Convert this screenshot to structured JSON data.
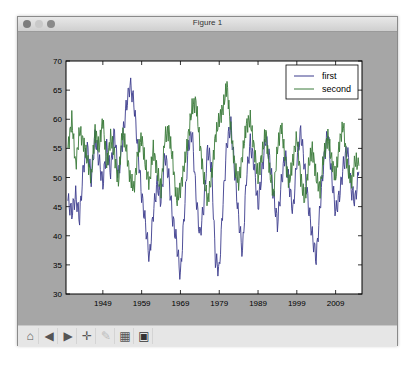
{
  "window": {
    "title": "Figure 1"
  },
  "toolbar": {
    "buttons": [
      {
        "name": "home-icon",
        "glyph": "⌂",
        "label": "Home"
      },
      {
        "name": "back-icon",
        "glyph": "◀",
        "label": "Back"
      },
      {
        "name": "forward-icon",
        "glyph": "▶",
        "label": "Forward"
      },
      {
        "name": "pan-icon",
        "glyph": "✛",
        "label": "Pan"
      },
      {
        "name": "zoom-rect-icon",
        "glyph": "✎",
        "label": "Zoom"
      },
      {
        "name": "subplots-icon",
        "glyph": "▦",
        "label": "Subplots"
      },
      {
        "name": "save-icon",
        "glyph": "▣",
        "label": "Save"
      }
    ]
  },
  "chart_data": {
    "type": "line",
    "title": "",
    "xlabel": "",
    "ylabel": "",
    "xlim": [
      1939.5,
      2015.8
    ],
    "ylim": [
      30,
      70
    ],
    "yticks": [
      30,
      35,
      40,
      45,
      50,
      55,
      60,
      65,
      70
    ],
    "xticks": [
      1949,
      1959,
      1969,
      1979,
      1989,
      1999,
      2009
    ],
    "grid": false,
    "legend": {
      "position": "upper right",
      "entries": [
        "first",
        "second"
      ]
    },
    "x": [
      1940,
      1941,
      1942,
      1943,
      1944,
      1945,
      1946,
      1947,
      1948,
      1949,
      1950,
      1951,
      1952,
      1953,
      1954,
      1955,
      1956,
      1957,
      1958,
      1959,
      1960,
      1961,
      1962,
      1963,
      1964,
      1965,
      1966,
      1967,
      1968,
      1969,
      1970,
      1971,
      1972,
      1973,
      1974,
      1975,
      1976,
      1977,
      1978,
      1979,
      1980,
      1981,
      1982,
      1983,
      1984,
      1985,
      1986,
      1987,
      1988,
      1989,
      1990,
      1991,
      1992,
      1993,
      1994,
      1995,
      1996,
      1997,
      1998,
      1999,
      2000,
      2001,
      2002,
      2003,
      2004,
      2005,
      2006,
      2007,
      2008,
      2009,
      2010,
      2011,
      2012,
      2013,
      2014,
      2015
    ],
    "series": [
      {
        "name": "first",
        "color": "#3b3b8c",
        "values": [
          46,
          44,
          47,
          43,
          52,
          55,
          50,
          57,
          53,
          49,
          55,
          51,
          58,
          50,
          56,
          62,
          66,
          63,
          55,
          47,
          42,
          36,
          44,
          49,
          46,
          54,
          50,
          43,
          39,
          33,
          44,
          55,
          58,
          47,
          40,
          45,
          55,
          52,
          36,
          34,
          46,
          56,
          59,
          51,
          43,
          37,
          50,
          56,
          52,
          45,
          51,
          57,
          53,
          47,
          42,
          49,
          54,
          49,
          44,
          53,
          58,
          52,
          45,
          40,
          36,
          45,
          53,
          58,
          50,
          44,
          47,
          52,
          55,
          48,
          46,
          51
        ]
      },
      {
        "name": "second",
        "color": "#3a7a3a",
        "values": [
          55,
          60,
          52,
          58,
          56,
          53,
          50,
          58,
          55,
          60,
          52,
          57,
          54,
          49,
          58,
          55,
          50,
          48,
          54,
          57,
          52,
          49,
          55,
          51,
          48,
          57,
          58,
          53,
          46,
          48,
          52,
          57,
          62,
          63,
          56,
          50,
          46,
          50,
          57,
          60,
          62,
          66,
          58,
          52,
          49,
          54,
          59,
          60,
          55,
          50,
          54,
          58,
          51,
          47,
          55,
          59,
          53,
          49,
          53,
          57,
          50,
          46,
          52,
          55,
          50,
          48,
          54,
          57,
          53,
          50,
          56,
          59,
          52,
          49,
          53,
          52
        ]
      }
    ]
  }
}
